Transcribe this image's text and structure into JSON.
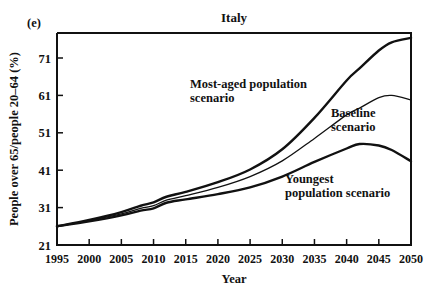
{
  "panel": {
    "label": "(e)"
  },
  "chart_data": {
    "type": "line",
    "title": "Italy",
    "xlabel": "Year",
    "ylabel": "People over 65/people 20–64 (%)",
    "xlim": [
      1995,
      2050
    ],
    "ylim": [
      21,
      76.5
    ],
    "xticks": [
      1995,
      2000,
      2005,
      2010,
      2015,
      2020,
      2025,
      2030,
      2035,
      2040,
      2045,
      2050
    ],
    "yticks": [
      21,
      31,
      41,
      51,
      61,
      71
    ],
    "xtick_labels": [
      "1995",
      "2000",
      "2005",
      "2010",
      "2015",
      "2020",
      "2025",
      "2030",
      "2035",
      "2040",
      "2045",
      "2050"
    ],
    "ytick_labels": [
      "21",
      "31",
      "41",
      "51",
      "61",
      "71"
    ],
    "grid": false,
    "legend": "inline-annotations",
    "x": [
      1995,
      2000,
      2005,
      2008,
      2010,
      2012,
      2015,
      2020,
      2025,
      2030,
      2035,
      2040,
      2042,
      2045,
      2047,
      2050
    ],
    "series": [
      {
        "name": "Most-aged population scenario",
        "label": "Most-aged population scenario",
        "style": "thick",
        "values": [
          26.0,
          27.7,
          29.8,
          31.5,
          32.4,
          33.9,
          35.2,
          37.8,
          41.2,
          46.6,
          55.0,
          65.0,
          68.2,
          73.0,
          75.2,
          76.4
        ]
      },
      {
        "name": "Baseline scenario",
        "label": "Baseline scenario",
        "style": "thin",
        "values": [
          26.0,
          27.5,
          29.3,
          30.8,
          31.5,
          33.0,
          34.2,
          36.4,
          39.3,
          43.5,
          49.5,
          55.8,
          57.6,
          60.4,
          61.0,
          59.8
        ]
      },
      {
        "name": "Youngest population scenario",
        "label": "Youngest population scenario",
        "style": "thick",
        "values": [
          26.0,
          27.3,
          28.9,
          30.2,
          30.8,
          32.3,
          33.2,
          34.6,
          36.4,
          39.3,
          43.2,
          46.8,
          48.0,
          47.6,
          46.4,
          43.4
        ]
      }
    ],
    "annotations": [
      {
        "name": "most-aged-label",
        "lines": [
          "Most-aged population",
          "scenario"
        ],
        "x": 190,
        "y": 88
      },
      {
        "name": "baseline-label",
        "lines": [
          "Baseline",
          "scenario"
        ],
        "x": 331,
        "y": 117
      },
      {
        "name": "youngest-label",
        "lines": [
          "Youngest",
          "population scenario"
        ],
        "x": 285,
        "y": 183
      }
    ]
  }
}
